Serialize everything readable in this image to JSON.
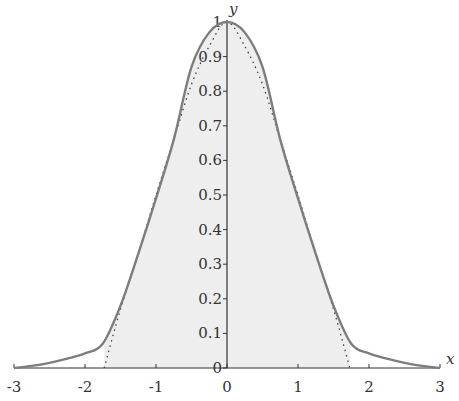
{
  "chart_data": {
    "type": "line",
    "title": "",
    "xlabel": "x",
    "ylabel": "y",
    "xlim": [
      -3,
      3
    ],
    "ylim": [
      0,
      1
    ],
    "grid": false,
    "legend": null,
    "x_ticks": [
      -3,
      -2,
      -1,
      0,
      1,
      2,
      3
    ],
    "x_tick_labels": [
      "-3",
      "-2",
      "-1",
      "0",
      "1",
      "2",
      "3"
    ],
    "y_ticks": [
      0,
      0.1,
      0.2,
      0.3,
      0.4,
      0.5,
      0.6,
      0.7,
      0.8,
      0.9,
      1
    ],
    "y_tick_labels": [
      "0",
      "0.1",
      "0.2",
      "0.3",
      "0.4",
      "0.5",
      "0.6",
      "0.7",
      "0.8",
      "0.9",
      "1"
    ],
    "series": [
      {
        "name": "solid curve",
        "style": "solid",
        "color": "#7a7a7a",
        "x": [
          -3,
          -2.75,
          -2.5,
          -2.25,
          -2,
          -1.75,
          -1.5,
          -1.25,
          -1,
          -0.75,
          -0.5,
          -0.25,
          0,
          0.25,
          0.5,
          0.75,
          1,
          1.25,
          1.5,
          1.75,
          2,
          2.25,
          2.5,
          2.75,
          3
        ],
        "y": [
          0,
          0.006,
          0.015,
          0.027,
          0.042,
          0.07,
          0.18,
          0.33,
          0.49,
          0.66,
          0.87,
          0.97,
          1,
          0.97,
          0.87,
          0.66,
          0.49,
          0.33,
          0.18,
          0.07,
          0.042,
          0.027,
          0.015,
          0.006,
          0
        ]
      },
      {
        "name": "dotted curve",
        "style": "dotted",
        "color": "#333333",
        "x": [
          -1.73,
          -1.5,
          -1.25,
          -1,
          -0.75,
          -0.5,
          -0.25,
          0,
          0.25,
          0.5,
          0.75,
          1,
          1.25,
          1.5,
          1.73
        ],
        "y": [
          0,
          0.17,
          0.33,
          0.5,
          0.66,
          0.82,
          0.93,
          1,
          0.93,
          0.82,
          0.66,
          0.5,
          0.33,
          0.17,
          0
        ]
      }
    ],
    "shaded_region": {
      "under": "solid curve",
      "x_range": [
        -1.73,
        1.73
      ],
      "color": "#eeeeee"
    }
  }
}
